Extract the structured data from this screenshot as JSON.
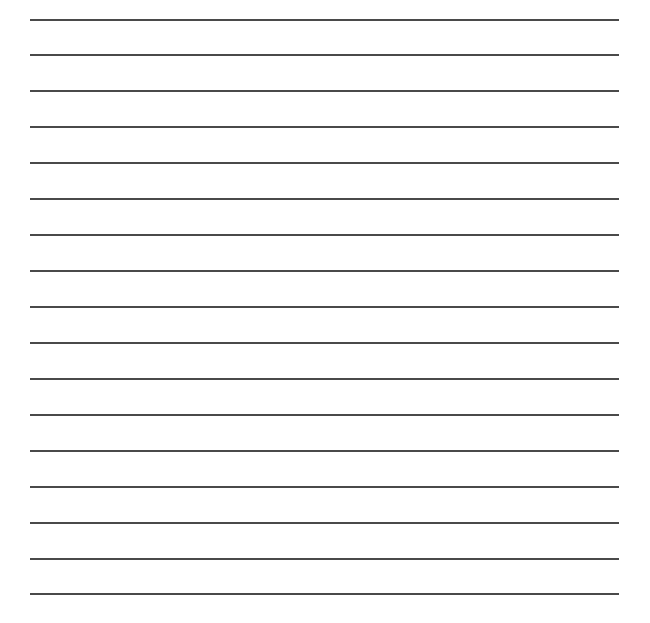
{
  "sheet": {
    "type": "lined-paper",
    "background_color": "#ffffff",
    "line_color": "#4a4a4a",
    "line_left": 30,
    "line_right": 619,
    "line_count": 17,
    "line_y": [
      19,
      54,
      90,
      126,
      162,
      198,
      234,
      270,
      306,
      342,
      378,
      414,
      450,
      486,
      522,
      558,
      593
    ]
  }
}
